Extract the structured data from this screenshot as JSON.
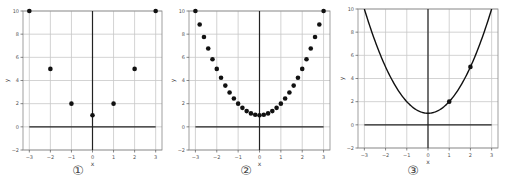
{
  "chart_data": [
    {
      "type": "scatter",
      "caption": "①",
      "title": "",
      "xlabel": "x",
      "ylabel": "y",
      "xlim": [
        -3.3,
        3.3
      ],
      "ylim": [
        -2,
        10
      ],
      "xticks": [
        -3,
        -2,
        -1,
        0,
        1,
        2,
        3
      ],
      "yticks": [
        -2,
        0,
        2,
        4,
        6,
        8,
        10
      ],
      "grid": true,
      "axis_lines": true,
      "series": [
        {
          "name": "points",
          "x": [
            -3,
            -2,
            -1,
            0,
            1,
            2,
            3
          ],
          "y": [
            10,
            5,
            2,
            1,
            2,
            5,
            10
          ]
        }
      ]
    },
    {
      "type": "scatter",
      "caption": "②",
      "title": "",
      "xlabel": "x",
      "ylabel": "y",
      "xlim": [
        -3.3,
        3.3
      ],
      "ylim": [
        -2,
        10
      ],
      "xticks": [
        -3,
        -2,
        -1,
        0,
        1,
        2,
        3
      ],
      "yticks": [
        -2,
        0,
        2,
        4,
        6,
        8,
        10
      ],
      "grid": true,
      "axis_lines": true,
      "series": [
        {
          "name": "points",
          "x": [
            -3,
            -2.8,
            -2.6,
            -2.4,
            -2.2,
            -2,
            -1.8,
            -1.6,
            -1.4,
            -1.2,
            -1,
            -0.8,
            -0.6,
            -0.4,
            -0.2,
            0,
            0.2,
            0.4,
            0.6,
            0.8,
            1,
            1.2,
            1.4,
            1.6,
            1.8,
            2,
            2.2,
            2.4,
            2.6,
            2.8,
            3
          ],
          "y": [
            10,
            8.84,
            7.76,
            6.76,
            5.84,
            5,
            4.24,
            3.56,
            2.96,
            2.44,
            2,
            1.64,
            1.36,
            1.16,
            1.04,
            1,
            1.04,
            1.16,
            1.36,
            1.64,
            2,
            2.44,
            2.96,
            3.56,
            4.24,
            5,
            5.84,
            6.76,
            7.76,
            8.84,
            10
          ]
        }
      ]
    },
    {
      "type": "line",
      "caption": "③",
      "title": "",
      "xlabel": "x",
      "ylabel": "y",
      "xlim": [
        -3.3,
        3.3
      ],
      "ylim": [
        -2,
        10
      ],
      "xticks": [
        -3,
        -2,
        -1,
        0,
        1,
        2,
        3
      ],
      "yticks": [
        -2,
        0,
        2,
        4,
        6,
        8,
        10
      ],
      "grid": true,
      "axis_lines": true,
      "function": "y = x^2 + 1",
      "series": [
        {
          "name": "curve",
          "x_range": [
            -3,
            3
          ]
        },
        {
          "name": "points",
          "x": [
            1,
            2
          ],
          "y": [
            2,
            5
          ]
        }
      ]
    }
  ],
  "panels": [
    {
      "left": 0,
      "plot": {
        "x0": 23,
        "x1": 162,
        "y0": 11,
        "y1": 150
      },
      "caption_pos": {
        "x": 78,
        "y": 172
      }
    },
    {
      "left": 0,
      "plot": {
        "x0": 189,
        "x1": 330,
        "y0": 11,
        "y1": 150
      },
      "caption_pos": {
        "x": 246,
        "y": 172
      }
    },
    {
      "left": 0,
      "plot": {
        "x0": 358,
        "x1": 498,
        "y0": 9,
        "y1": 148
      },
      "caption_pos": {
        "x": 413,
        "y": 172
      }
    }
  ],
  "style": {
    "grid_color": "#c8c8c8",
    "axis_color": "#222222",
    "frame_color": "#888888",
    "marker_color": "#111111",
    "tick_color": "#555555"
  }
}
